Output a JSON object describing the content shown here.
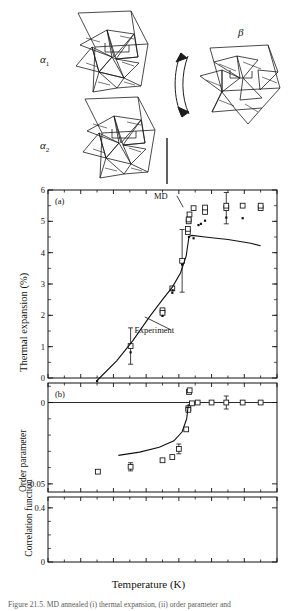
{
  "figure": {
    "caption_partial": "Figure 21.5. MD annealed (i) thermal expansion, (ii) order parameter and",
    "xlabel": "Temperature (K)",
    "structures": {
      "alpha1_label": "α",
      "alpha1_sub": "1",
      "alpha2_label": "α",
      "alpha2_sub": "2",
      "beta_label": "β",
      "arrow_name": "phase-transition-double-arrow"
    }
  },
  "chart_data": [
    {
      "type": "scatter",
      "panel": "a",
      "panel_tag": "(a)",
      "title": "",
      "xlabel": "Temperature (K)",
      "ylabel": "Thermal expansion (%)",
      "xlim": [
        0,
        1400
      ],
      "ylim": [
        0,
        6
      ],
      "xticks": [
        0,
        200,
        400,
        600,
        800,
        1000,
        1200,
        1400
      ],
      "yticks": [
        0,
        1,
        2,
        3,
        4,
        5,
        6
      ],
      "xticklabels": [
        "0",
        "200",
        "400",
        "600",
        "800",
        "1000",
        "1200",
        "1400"
      ],
      "yticklabels": [
        "0",
        "1",
        "2",
        "3",
        "4",
        "5",
        "6"
      ],
      "grid": false,
      "annotations": [
        {
          "text": "MD",
          "x": 690,
          "y": 5.72,
          "leader_to_x": 845,
          "leader_to_y": 5.45
        },
        {
          "text": "Experiment",
          "x": 650,
          "y": 1.45,
          "leader_to_x": 610,
          "leader_to_y": 1.95
        }
      ],
      "series": [
        {
          "name": "MD open squares",
          "marker": "open-square",
          "points": [
            {
              "x": 505,
              "y": 1.02,
              "yerr": 0.58
            },
            {
              "x": 700,
              "y": 2.16
            },
            {
              "x": 700,
              "y": 2.08
            },
            {
              "x": 760,
              "y": 2.86
            },
            {
              "x": 820,
              "y": 3.74,
              "yerr": 1.0
            },
            {
              "x": 855,
              "y": 4.66
            },
            {
              "x": 855,
              "y": 4.76
            },
            {
              "x": 860,
              "y": 5.0
            },
            {
              "x": 860,
              "y": 5.06
            },
            {
              "x": 865,
              "y": 5.22
            },
            {
              "x": 890,
              "y": 5.42
            },
            {
              "x": 960,
              "y": 5.3
            },
            {
              "x": 960,
              "y": 5.44
            },
            {
              "x": 1090,
              "y": 5.42,
              "yerr": 0.5
            },
            {
              "x": 1090,
              "y": 5.5
            },
            {
              "x": 1190,
              "y": 5.5
            },
            {
              "x": 1300,
              "y": 5.42
            },
            {
              "x": 1300,
              "y": 5.5
            }
          ]
        },
        {
          "name": "MD filled dots",
          "marker": "filled-dot",
          "points": [
            {
              "x": 300,
              "y": -0.1
            },
            {
              "x": 505,
              "y": 0.82
            },
            {
              "x": 700,
              "y": 1.98
            },
            {
              "x": 760,
              "y": 2.72
            },
            {
              "x": 762,
              "y": 2.8
            },
            {
              "x": 820,
              "y": 3.62
            },
            {
              "x": 862,
              "y": 4.5
            },
            {
              "x": 890,
              "y": 4.46
            },
            {
              "x": 920,
              "y": 4.88
            },
            {
              "x": 935,
              "y": 4.92
            },
            {
              "x": 960,
              "y": 5.02
            },
            {
              "x": 1090,
              "y": 5.12
            },
            {
              "x": 1190,
              "y": 5.1
            }
          ]
        },
        {
          "name": "Experiment curve",
          "marker": "line",
          "points": [
            {
              "x": 300,
              "y": -0.08
            },
            {
              "x": 420,
              "y": 0.55
            },
            {
              "x": 520,
              "y": 1.2
            },
            {
              "x": 620,
              "y": 1.95
            },
            {
              "x": 700,
              "y": 2.5
            },
            {
              "x": 760,
              "y": 2.9
            },
            {
              "x": 810,
              "y": 3.35
            },
            {
              "x": 845,
              "y": 3.9
            },
            {
              "x": 862,
              "y": 4.52
            },
            {
              "x": 880,
              "y": 4.55
            },
            {
              "x": 960,
              "y": 4.5
            },
            {
              "x": 1100,
              "y": 4.42
            },
            {
              "x": 1240,
              "y": 4.3
            },
            {
              "x": 1300,
              "y": 4.22
            }
          ]
        }
      ]
    },
    {
      "type": "scatter",
      "panel": "b",
      "panel_tag": "(b)",
      "title": "",
      "xlabel": "Temperature (K)",
      "ylabel": "Order parameter",
      "xlim": [
        0,
        1400
      ],
      "ylim": [
        -0.055,
        0.012
      ],
      "xticks": [
        0,
        200,
        400,
        600,
        800,
        1000,
        1200,
        1400
      ],
      "yticks": [
        0,
        -0.05
      ],
      "yticklabels": [
        "0",
        "-0.05"
      ],
      "grid": false,
      "series": [
        {
          "name": "MD order parameter squares",
          "marker": "open-square",
          "points": [
            {
              "x": 305,
              "y": -0.0425
            },
            {
              "x": 505,
              "y": -0.0395,
              "yerr": 0.0025
            },
            {
              "x": 700,
              "y": -0.0355
            },
            {
              "x": 760,
              "y": -0.0335
            },
            {
              "x": 800,
              "y": -0.0285,
              "yerr": 0.003
            },
            {
              "x": 845,
              "y": -0.0165
            },
            {
              "x": 858,
              "y": -0.0035
            },
            {
              "x": 858,
              "y": -0.0045
            },
            {
              "x": 862,
              "y": 0.0065
            },
            {
              "x": 866,
              "y": 0.0075
            },
            {
              "x": 880,
              "y": -0.0005
            },
            {
              "x": 915,
              "y": 0.0
            },
            {
              "x": 1000,
              "y": 0.0
            },
            {
              "x": 1090,
              "y": 0.0,
              "yerr": 0.004
            },
            {
              "x": 1190,
              "y": 0.0
            },
            {
              "x": 1300,
              "y": 0.0
            }
          ]
        },
        {
          "name": "Experiment curve",
          "marker": "line",
          "points": [
            {
              "x": 430,
              "y": -0.0325
            },
            {
              "x": 560,
              "y": -0.0305
            },
            {
              "x": 680,
              "y": -0.0275
            },
            {
              "x": 770,
              "y": -0.0235
            },
            {
              "x": 820,
              "y": -0.018
            },
            {
              "x": 848,
              "y": -0.01
            },
            {
              "x": 858,
              "y": -0.001
            }
          ]
        }
      ]
    },
    {
      "type": "scatter",
      "panel": "c",
      "panel_tag": "(c)",
      "title": "",
      "xlabel": "Temperature (K)",
      "ylabel": "Correlation function",
      "xlim": [
        0,
        1400
      ],
      "ylim": [
        0,
        0.48
      ],
      "xticks": [
        0,
        200,
        400,
        600,
        800,
        1000,
        1200,
        1400
      ],
      "yticks": [
        0,
        0.4
      ],
      "yticklabels": [
        "0",
        "0.4"
      ],
      "grid": false,
      "series": [
        {
          "name": "Correlation function squares",
          "marker": "open-square",
          "points": [
            {
              "x": 305,
              "y": 0.012
            },
            {
              "x": 508,
              "y": 0.015
            },
            {
              "x": 700,
              "y": 0.022
            },
            {
              "x": 735,
              "y": 0.035
            },
            {
              "x": 760,
              "y": 0.105
            },
            {
              "x": 855,
              "y": 0.425
            },
            {
              "x": 862,
              "y": 0.275
            },
            {
              "x": 858,
              "y": 0.235
            },
            {
              "x": 862,
              "y": 0.215
            },
            {
              "x": 900,
              "y": 0.135
            },
            {
              "x": 900,
              "y": 0.095
            },
            {
              "x": 1000,
              "y": 0.155
            },
            {
              "x": 1000,
              "y": 0.095
            },
            {
              "x": 1100,
              "y": 0.045
            },
            {
              "x": 1100,
              "y": 0.035
            },
            {
              "x": 1195,
              "y": 0.085
            },
            {
              "x": 1195,
              "y": 0.065
            },
            {
              "x": 1300,
              "y": 0.075
            },
            {
              "x": 1300,
              "y": 0.04
            }
          ]
        }
      ]
    }
  ]
}
